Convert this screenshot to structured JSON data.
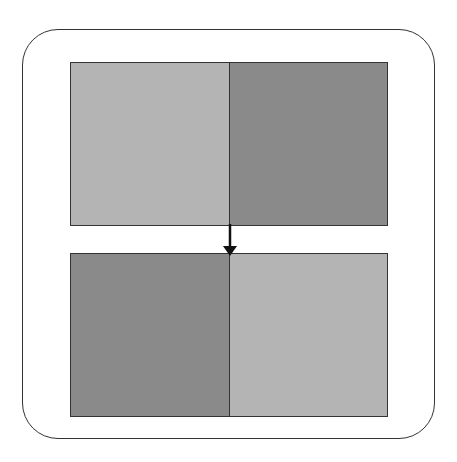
{
  "diagram": {
    "colors": {
      "light": "#b4b4b4",
      "dark": "#8a8a8a",
      "border": "#333333",
      "background": "#ffffff"
    },
    "top_panel": {
      "left": "light",
      "right": "dark"
    },
    "bottom_panel": {
      "left": "dark",
      "right": "light"
    },
    "arrow": {
      "direction": "down"
    }
  }
}
